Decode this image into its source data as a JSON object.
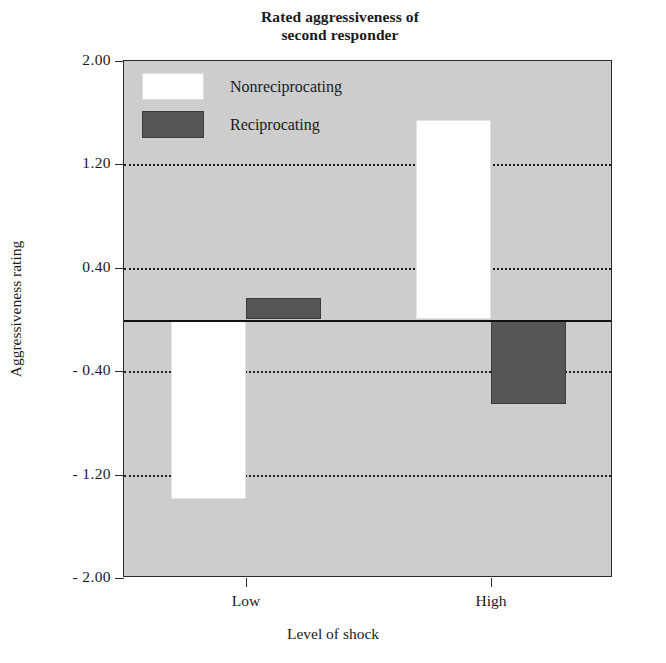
{
  "chart_data": {
    "type": "bar",
    "title": "Rated aggressiveness of second responder",
    "title_line1": "Rated aggressiveness of",
    "title_line2": "second responder",
    "xlabel": "Level of shock",
    "ylabel": "Aggressiveness rating",
    "categories": [
      "Low",
      "High"
    ],
    "series": [
      {
        "name": "Nonreciprocating",
        "color": "#ffffff",
        "values": [
          -1.39,
          1.54
        ]
      },
      {
        "name": "Reciprocating",
        "color": "#565656",
        "values": [
          0.17,
          -0.65
        ]
      }
    ],
    "ylim": [
      -2.0,
      2.0
    ],
    "yticks": [
      2.0,
      1.2,
      0.4,
      -0.4,
      -1.2,
      -2.0
    ],
    "ytick_labels": [
      "2.00",
      "1.20",
      "0.40",
      "- 0.40",
      "- 1.20",
      "- 2.00"
    ],
    "gridlines": [
      1.2,
      0.4,
      -0.4,
      -1.2
    ],
    "zero_line": 0,
    "grid": true,
    "legend_position": "top-left",
    "plot_background": "#cdcdcd",
    "axis_color": "#2b2b2b"
  },
  "legend": {
    "items": [
      {
        "label": "Nonreciprocating",
        "swatch": "white"
      },
      {
        "label": "Reciprocating",
        "swatch": "dark"
      }
    ]
  }
}
